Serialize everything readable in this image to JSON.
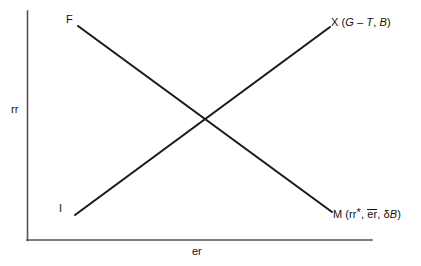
{
  "figure": {
    "type": "economics-cross-diagram",
    "background_color": "#ffffff",
    "line_color": "#1a1a1a",
    "axis_color": "#555555"
  },
  "axes": {
    "y_label": "rr",
    "x_label": "er",
    "y_axis": {
      "x": 27,
      "y_top": 11,
      "y_bottom": 240
    },
    "x_axis": {
      "y": 240,
      "x_left": 27,
      "x_right": 372
    }
  },
  "curves": [
    {
      "id": "fm-curve",
      "slope": "downward",
      "start_label": "F",
      "end_label_prefix": "M",
      "end_label_args": "(rr*, er, δB)",
      "start": {
        "x": 78,
        "y": 26
      },
      "end": {
        "x": 332,
        "y": 212
      }
    },
    {
      "id": "ix-curve",
      "slope": "upward",
      "start_label": "I",
      "end_label_prefix": "X",
      "end_label_args": "(G – T, B)",
      "start": {
        "x": 75,
        "y": 215
      },
      "end": {
        "x": 330,
        "y": 27
      }
    }
  ],
  "labels": {
    "f": "F",
    "i": "I",
    "x_name": "X",
    "x_open_paren": "(",
    "x_g": "G",
    "x_minus": "–",
    "x_t": "T",
    "x_comma": ",",
    "x_b": "B",
    "x_close_paren": ")",
    "m_name": "M",
    "m_open_paren": "(",
    "m_rr": "rr",
    "m_star": "*",
    "m_comma1": ",",
    "m_er_bar": "er",
    "m_comma2": ",",
    "m_delta": "δ",
    "m_b": "B",
    "m_close_paren": ")"
  },
  "intersection": {
    "x": 203,
    "y": 118
  }
}
